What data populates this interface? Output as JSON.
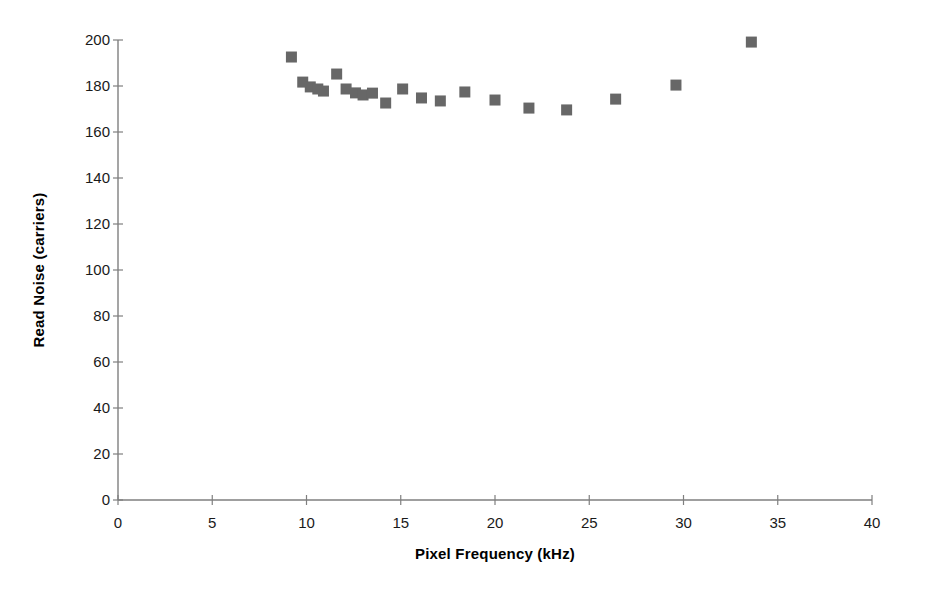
{
  "chart_data": {
    "type": "scatter",
    "title": "",
    "xlabel": "Pixel Frequency (kHz)",
    "ylabel": "Read Noise (carriers)",
    "xlim": [
      0,
      40
    ],
    "ylim": [
      0,
      200
    ],
    "xticks": [
      0,
      5,
      10,
      15,
      20,
      25,
      30,
      35,
      40
    ],
    "yticks": [
      0,
      20,
      40,
      60,
      80,
      100,
      120,
      140,
      160,
      180,
      200
    ],
    "xtick_labels": [
      "0",
      "5",
      "10",
      "15",
      "20",
      "25",
      "30",
      "35",
      "40"
    ],
    "ytick_labels": [
      "0",
      "20",
      "40",
      "60",
      "80",
      "100",
      "120",
      "140",
      "160",
      "180",
      "200"
    ],
    "grid": false,
    "legend": null,
    "marker": {
      "shape": "square",
      "color": "#676767",
      "size_px": 11
    },
    "series": [
      {
        "name": "Read Noise vs Pixel Frequency",
        "points": [
          {
            "x": 9.2,
            "y": 192.6
          },
          {
            "x": 9.8,
            "y": 181.7
          },
          {
            "x": 10.2,
            "y": 179.6
          },
          {
            "x": 10.6,
            "y": 178.7
          },
          {
            "x": 10.9,
            "y": 177.8
          },
          {
            "x": 11.6,
            "y": 185.2
          },
          {
            "x": 12.1,
            "y": 178.7
          },
          {
            "x": 12.6,
            "y": 177.0
          },
          {
            "x": 13.0,
            "y": 176.1
          },
          {
            "x": 13.5,
            "y": 176.9
          },
          {
            "x": 14.2,
            "y": 172.6
          },
          {
            "x": 15.1,
            "y": 178.7
          },
          {
            "x": 16.1,
            "y": 174.8
          },
          {
            "x": 17.1,
            "y": 173.5
          },
          {
            "x": 18.4,
            "y": 177.4
          },
          {
            "x": 20.0,
            "y": 173.9
          },
          {
            "x": 21.8,
            "y": 170.4
          },
          {
            "x": 23.8,
            "y": 169.6
          },
          {
            "x": 26.4,
            "y": 174.3
          },
          {
            "x": 29.6,
            "y": 180.4
          },
          {
            "x": 33.6,
            "y": 199.1
          }
        ]
      }
    ]
  },
  "axes": {
    "geometry": {
      "x0_px": 118,
      "y0_px": 500,
      "x_span_px": 754,
      "y_span_px": 460
    }
  }
}
